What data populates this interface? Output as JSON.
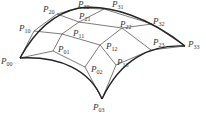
{
  "diagram": {
    "type": "bezier-surface-control-net",
    "colors": {
      "line": "#444444",
      "edge": "#222222",
      "text": "#333333",
      "background": "#ffffff"
    },
    "points": [
      {
        "id": "P00",
        "base": "P",
        "sub": "00",
        "x": 20,
        "y": 58,
        "lx": 1,
        "ly": 64
      },
      {
        "id": "P10",
        "base": "P",
        "sub": "10",
        "x": 34,
        "y": 31,
        "lx": 19,
        "ly": 31
      },
      {
        "id": "P20",
        "base": "P",
        "sub": "20",
        "x": 57,
        "y": 14,
        "lx": 43,
        "ly": 12
      },
      {
        "id": "P30",
        "base": "P",
        "sub": "30",
        "x": 79,
        "y": 8,
        "lx": 78,
        "ly": 7
      },
      {
        "id": "P01",
        "base": "P",
        "sub": "01",
        "x": 53,
        "y": 51,
        "lx": 58,
        "ly": 52
      },
      {
        "id": "P11",
        "base": "P",
        "sub": "11",
        "x": 62,
        "y": 34,
        "lx": 73,
        "ly": 36
      },
      {
        "id": "P21",
        "base": "P",
        "sub": "21",
        "x": 79,
        "y": 22,
        "lx": 79,
        "ly": 19
      },
      {
        "id": "P31",
        "base": "P",
        "sub": "31",
        "x": 104,
        "y": 9,
        "lx": 112,
        "ly": 7
      },
      {
        "id": "P02",
        "base": "P",
        "sub": "02",
        "x": 85,
        "y": 67,
        "lx": 91,
        "ly": 72
      },
      {
        "id": "P12",
        "base": "P",
        "sub": "12",
        "x": 100,
        "y": 45,
        "lx": 106,
        "ly": 49
      },
      {
        "id": "P22",
        "base": "P",
        "sub": "22",
        "x": 122,
        "y": 28,
        "lx": 120,
        "ly": 27
      },
      {
        "id": "P32",
        "base": "P",
        "sub": "32",
        "x": 152,
        "y": 24,
        "lx": 153,
        "ly": 24
      },
      {
        "id": "P03",
        "base": "P",
        "sub": "03",
        "x": 102,
        "y": 99,
        "lx": 93,
        "ly": 110
      },
      {
        "id": "P13",
        "base": "P",
        "sub": "13",
        "x": 116,
        "y": 65,
        "lx": 117,
        "ly": 65
      },
      {
        "id": "P23",
        "base": "P",
        "sub": "23",
        "x": 151,
        "y": 50,
        "lx": 153,
        "ly": 45
      },
      {
        "id": "P33",
        "base": "P",
        "sub": "33",
        "x": 185,
        "y": 46,
        "lx": 188,
        "ly": 47
      }
    ],
    "grid_rows": [
      [
        "P00",
        "P10",
        "P20",
        "P30"
      ],
      [
        "P01",
        "P11",
        "P21",
        "P31"
      ],
      [
        "P02",
        "P12",
        "P22",
        "P32"
      ],
      [
        "P03",
        "P13",
        "P23",
        "P33"
      ]
    ],
    "boundary_curves": [
      "M20,58 C32,36 50,14 79,8",
      "M79,8 C110,4 150,18 185,46",
      "M185,46 C150,44 120,60 102,99",
      "M102,99 C90,70 60,56 20,58"
    ]
  }
}
